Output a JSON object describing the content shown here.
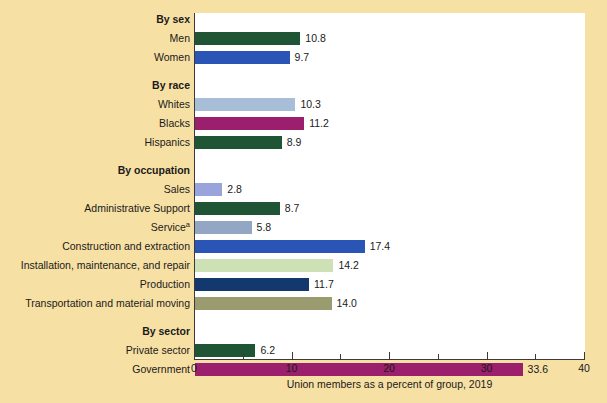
{
  "chart_data": {
    "type": "bar",
    "orientation": "horizontal",
    "title": "",
    "xlabel": "Union members as a percent of group, 2019",
    "ylabel": "",
    "xlim": [
      0,
      40
    ],
    "xticks": [
      0,
      10,
      20,
      30,
      40
    ],
    "xtick_labels": [
      "0",
      "10",
      "20",
      "30",
      "40"
    ],
    "minor_xticks": [
      5,
      15,
      25,
      35
    ],
    "grid": false,
    "legend": "none",
    "footnote_marker": "a",
    "rows": [
      {
        "kind": "heading",
        "label": "By sex",
        "value": null,
        "value_text": "",
        "color": ""
      },
      {
        "kind": "bar",
        "label": "Men",
        "value": 10.8,
        "value_text": "10.8",
        "color": "#1f5434"
      },
      {
        "kind": "bar",
        "label": "Women",
        "value": 9.7,
        "value_text": "9.7",
        "color": "#2a55b5"
      },
      {
        "kind": "spacer",
        "label": "",
        "value": null,
        "value_text": "",
        "color": ""
      },
      {
        "kind": "heading",
        "label": "By race",
        "value": null,
        "value_text": "",
        "color": ""
      },
      {
        "kind": "bar",
        "label": "Whites",
        "value": 10.3,
        "value_text": "10.3",
        "color": "#a8bdd8"
      },
      {
        "kind": "bar",
        "label": "Blacks",
        "value": 11.2,
        "value_text": "11.2",
        "color": "#9c1f6d"
      },
      {
        "kind": "bar",
        "label": "Hispanics",
        "value": 8.9,
        "value_text": "8.9",
        "color": "#1f5434"
      },
      {
        "kind": "spacer",
        "label": "",
        "value": null,
        "value_text": "",
        "color": ""
      },
      {
        "kind": "heading",
        "label": "By occupation",
        "value": null,
        "value_text": "",
        "color": ""
      },
      {
        "kind": "bar",
        "label": "Sales",
        "value": 2.8,
        "value_text": "2.8",
        "color": "#9aa4dc"
      },
      {
        "kind": "bar",
        "label": "Administrative Support",
        "value": 8.7,
        "value_text": "8.7",
        "color": "#1f5434"
      },
      {
        "kind": "bar",
        "label": "Service",
        "value": 5.8,
        "value_text": "5.8",
        "color": "#93a6c4",
        "superscript": "a"
      },
      {
        "kind": "bar",
        "label": "Construction and extraction",
        "value": 17.4,
        "value_text": "17.4",
        "color": "#2a55b5"
      },
      {
        "kind": "bar",
        "label": "Installation, maintenance, and repair",
        "value": 14.2,
        "value_text": "14.2",
        "color": "#cde0b6"
      },
      {
        "kind": "bar",
        "label": "Production",
        "value": 11.7,
        "value_text": "11.7",
        "color": "#13386e"
      },
      {
        "kind": "bar",
        "label": "Transportation and material moving",
        "value": 14.0,
        "value_text": "14.0",
        "color": "#9a9b6e"
      },
      {
        "kind": "spacer",
        "label": "",
        "value": null,
        "value_text": "",
        "color": ""
      },
      {
        "kind": "heading",
        "label": "By sector",
        "value": null,
        "value_text": "",
        "color": ""
      },
      {
        "kind": "bar",
        "label": "Private sector",
        "value": 6.2,
        "value_text": "6.2",
        "color": "#1f5434"
      },
      {
        "kind": "bar",
        "label": "Government",
        "value": 33.6,
        "value_text": "33.6",
        "color": "#9c1f6d"
      }
    ]
  },
  "colors": {
    "background": "#f7e0a4",
    "plot_background": "#ffffff",
    "axis": "#3a3a3a",
    "text": "#1a1a1a"
  }
}
